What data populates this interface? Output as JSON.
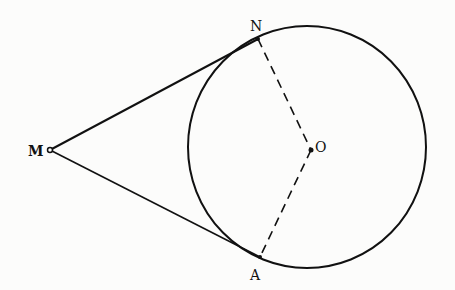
{
  "diagram": {
    "type": "geometry",
    "colors": {
      "stroke": "#111111",
      "background": "#fcfcfb"
    },
    "circle": {
      "center": "O",
      "cx": 307,
      "cy": 147,
      "rx": 119,
      "ry": 121
    },
    "points": {
      "M": {
        "label": "M",
        "x": 50,
        "y": 150
      },
      "N": {
        "label": "N",
        "x": 258,
        "y": 39
      },
      "O": {
        "label": "O",
        "x": 311,
        "y": 150
      },
      "A": {
        "label": "A",
        "x": 260,
        "y": 257
      }
    },
    "segments": [
      {
        "from": "M",
        "to": "N",
        "style": "solid"
      },
      {
        "from": "M",
        "to": "A",
        "style": "solid"
      },
      {
        "from": "N",
        "to": "O",
        "style": "dashed"
      },
      {
        "from": "O",
        "to": "A",
        "style": "dashed"
      }
    ]
  }
}
